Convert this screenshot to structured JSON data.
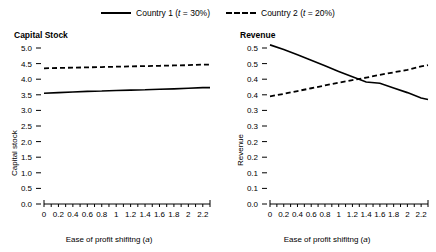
{
  "legend": {
    "entries": [
      {
        "label": "Country 1 (t = 30%)",
        "style": "solid",
        "name": "country-1"
      },
      {
        "label": "Country 2 (t = 20%)",
        "style": "dashed",
        "name": "country-2"
      }
    ]
  },
  "chart_data": [
    {
      "type": "line",
      "title": "Capital Stock",
      "xlabel": "Ease of profit shifitng (a)",
      "ylabel": "Capital stock",
      "xlim": [
        0,
        2.3
      ],
      "ylim": [
        0,
        5.0
      ],
      "grid": false,
      "legend_position": "top-center",
      "xticks": [
        0,
        0.1,
        0.2,
        0.3,
        0.4,
        0.5,
        0.6,
        0.7,
        0.8,
        0.9,
        1,
        1.1,
        1.2,
        1.3,
        1.4,
        1.5,
        1.6,
        1.7,
        1.8,
        1.9,
        2,
        2.1,
        2.2,
        2.3
      ],
      "xticklabels": [
        "0",
        "",
        "0.2",
        "",
        "0.4",
        "",
        "0.6",
        "",
        "0.8",
        "",
        "1",
        "",
        "1.2",
        "",
        "1.4",
        "",
        "1.6",
        "",
        "1.8",
        "",
        "2",
        "",
        "2.2",
        ""
      ],
      "yticks": [
        0,
        0.5,
        1.0,
        1.5,
        2.0,
        2.5,
        3.0,
        3.5,
        4.0,
        4.5,
        5.0
      ],
      "yticklabels": [
        "0.0",
        "0.5",
        "1.0",
        "1.5",
        "2.0",
        "2.5",
        "3.0",
        "3.5",
        "4.0",
        "4.5",
        "5.0"
      ],
      "x": [
        0,
        0.2,
        0.4,
        0.6,
        0.8,
        1.0,
        1.2,
        1.4,
        1.6,
        1.8,
        2.0,
        2.2,
        2.3
      ],
      "series": [
        {
          "name": "Country 1 (t = 30%)",
          "style": "solid",
          "values": [
            3.55,
            3.57,
            3.59,
            3.61,
            3.62,
            3.64,
            3.65,
            3.66,
            3.68,
            3.69,
            3.71,
            3.73,
            3.73
          ]
        },
        {
          "name": "Country 2 (t = 20%)",
          "style": "dashed",
          "values": [
            4.35,
            4.36,
            4.37,
            4.38,
            4.39,
            4.4,
            4.41,
            4.42,
            4.43,
            4.44,
            4.45,
            4.47,
            4.47
          ]
        }
      ]
    },
    {
      "type": "line",
      "title": "Revenue",
      "xlabel": "Ease of profit shifitng (a)",
      "ylabel": "Revenue",
      "xlim": [
        0,
        2.3
      ],
      "ylim": [
        0,
        0.5
      ],
      "grid": false,
      "legend_position": "top-center",
      "xticks": [
        0,
        0.1,
        0.2,
        0.3,
        0.4,
        0.5,
        0.6,
        0.7,
        0.8,
        0.9,
        1,
        1.1,
        1.2,
        1.3,
        1.4,
        1.5,
        1.6,
        1.7,
        1.8,
        1.9,
        2,
        2.1,
        2.2,
        2.3
      ],
      "xticklabels": [
        "0",
        "",
        "0.2",
        "",
        "0.4",
        "",
        "0.6",
        "",
        "0.8",
        "",
        "1",
        "",
        "1.2",
        "",
        "1.4",
        "",
        "1.6",
        "",
        "1.8",
        "",
        "2",
        "",
        "2.2",
        ""
      ],
      "yticks": [
        0,
        0.05,
        0.1,
        0.15,
        0.2,
        0.25,
        0.3,
        0.35,
        0.4,
        0.45,
        0.5
      ],
      "yticklabels": [
        "0.0",
        "0.1",
        "0.1",
        "0.2",
        "0.2",
        "0.3",
        "0.3",
        "0.4",
        "0.4",
        "0.5",
        "0.5"
      ],
      "x": [
        0,
        0.2,
        0.4,
        0.6,
        0.8,
        1.0,
        1.2,
        1.4,
        1.6,
        1.8,
        2.0,
        2.2,
        2.3
      ],
      "series": [
        {
          "name": "Country 1 (t = 30%)",
          "style": "solid",
          "values": [
            0.51,
            0.495,
            0.478,
            0.461,
            0.443,
            0.425,
            0.408,
            0.391,
            0.387,
            0.372,
            0.357,
            0.34,
            0.335
          ]
        },
        {
          "name": "Country 2 (t = 20%)",
          "style": "dashed",
          "values": [
            0.345,
            0.353,
            0.362,
            0.371,
            0.38,
            0.389,
            0.397,
            0.405,
            0.414,
            0.422,
            0.43,
            0.441,
            0.445
          ]
        }
      ]
    }
  ]
}
